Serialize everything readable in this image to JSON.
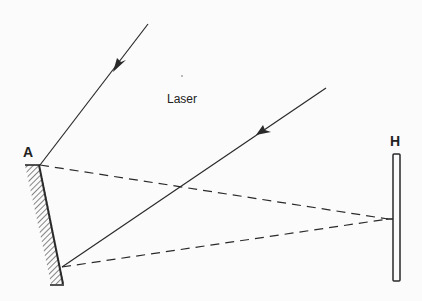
{
  "diagram": {
    "title": "",
    "labels": {
      "laser": "Laser",
      "mirror": "A",
      "plate": "H"
    },
    "elements": {
      "laser_beam_1": {
        "from": [
          148,
          24
        ],
        "to": [
          40,
          165
        ],
        "arrow_at": [
          120,
          62
        ],
        "style": "solid"
      },
      "laser_beam_2": {
        "from": [
          326,
          88
        ],
        "to": [
          62,
          267
        ],
        "arrow_at": [
          260,
          132
        ],
        "style": "solid"
      },
      "reflected_ray_1": {
        "from": [
          40,
          165
        ],
        "to": [
          388,
          219
        ],
        "style": "dashed"
      },
      "reflected_ray_2": {
        "from": [
          62,
          267
        ],
        "to": [
          388,
          219
        ],
        "style": "dashed"
      },
      "mirror_A": {
        "top": [
          38,
          165
        ],
        "bottom": [
          62,
          284
        ],
        "hatched_side": "left"
      },
      "plate_H": {
        "x": 393,
        "y": 154,
        "width": 7,
        "height": 127
      }
    },
    "colors": {
      "line": "#2a2a2a",
      "background": "#fbfbfb"
    }
  }
}
